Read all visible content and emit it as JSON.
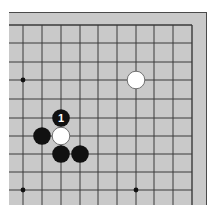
{
  "board": {
    "view": "top-right corner",
    "colors": {
      "board": "#c9c9c9",
      "line": "#3a3a3a",
      "frame": "#4a4a4a",
      "black_stone": "#111111",
      "white_stone": "#ffffff",
      "label": "#ffffff"
    },
    "grid": {
      "x_lines": [
        23,
        42,
        61,
        80,
        98,
        117,
        136,
        154,
        173,
        192
      ],
      "y_lines": [
        25,
        43,
        62,
        80,
        99,
        118,
        136,
        154,
        172,
        190
      ],
      "left_edge": 9,
      "bottom_edge": 205
    },
    "hoshi": [
      {
        "x": 23,
        "y": 80
      },
      {
        "x": 23,
        "y": 190
      },
      {
        "x": 136,
        "y": 190
      }
    ],
    "stones": [
      {
        "color": "white",
        "x": 136,
        "y": 80,
        "label": ""
      },
      {
        "color": "black",
        "x": 61,
        "y": 118,
        "label": "1"
      },
      {
        "color": "black",
        "x": 42,
        "y": 136,
        "label": ""
      },
      {
        "color": "white",
        "x": 61,
        "y": 136,
        "label": ""
      },
      {
        "color": "black",
        "x": 61,
        "y": 154,
        "label": ""
      },
      {
        "color": "black",
        "x": 80,
        "y": 154,
        "label": ""
      }
    ],
    "move_label": "1"
  }
}
